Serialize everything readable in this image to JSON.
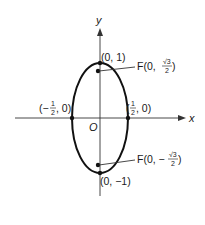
{
  "figure": {
    "type": "ellipse-diagram",
    "axes": {
      "x_label": "x",
      "y_label": "y",
      "origin_label": "O"
    },
    "ellipse": {
      "center": [
        0,
        0
      ],
      "semi_major_axis": 1,
      "semi_minor_axis": 0.5,
      "orientation": "vertical",
      "stroke_color": "#111111"
    },
    "points": [
      {
        "id": "top-vertex",
        "label": "(0, 1)"
      },
      {
        "id": "bottom-vertex",
        "label": "(0, −1)"
      },
      {
        "id": "left-vertex",
        "label_open": "(−",
        "label_num": "1",
        "label_den": "2",
        "label_close": ", 0)"
      },
      {
        "id": "right-vertex",
        "label_open": "(",
        "label_num": "1",
        "label_den": "2",
        "label_close": ", 0)"
      }
    ],
    "foci": [
      {
        "id": "focus-upper",
        "label_prefix": "F(0, ",
        "label_num": "√3",
        "label_den": "2",
        "label_suffix": ")"
      },
      {
        "id": "focus-lower",
        "label_prefix": "F(0, −",
        "label_num": "√3",
        "label_den": "2",
        "label_suffix": ")"
      }
    ]
  }
}
